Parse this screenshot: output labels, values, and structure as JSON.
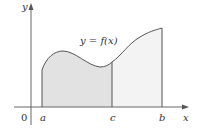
{
  "diagram": {
    "type": "area-under-curve",
    "curve_label": "y = f(x)",
    "axes": {
      "x_label": "x",
      "y_label": "y",
      "origin_label": "0"
    },
    "points": {
      "a": "a",
      "c": "c",
      "b": "b"
    },
    "colors": {
      "left_region": "#e2e2e2",
      "right_region": "#f3f3f3",
      "line": "#555555"
    }
  }
}
